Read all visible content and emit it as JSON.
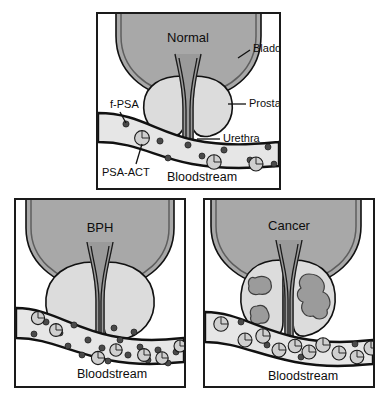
{
  "figure": {
    "background_color": "#ffffff",
    "border_color": "#1a1a1a"
  },
  "colors": {
    "bladder_fill": "#a8a8a8",
    "bladder_wall_inner": "#6e6e6e",
    "outline": "#111111",
    "prostate_fill": "#dcdcdc",
    "urethra_fill": "#9a9a9a",
    "vessel_fill": "#e6e6e6",
    "tumor_fill": "#9b9b9b",
    "fpsa_fill": "#4a4a4a",
    "psaact_fill": "#cfcfcf",
    "panel_background": "#ffffff",
    "text": "#0d0d0d"
  },
  "legend": {
    "fpsa_name": "free PSA particle",
    "psaact_name": "PSA-ACT complex particle"
  },
  "panels": [
    {
      "id": "normal",
      "title": "Normal",
      "bloodstream_label": "Bloodstream",
      "callouts": [
        {
          "id": "bladder",
          "label": "Bladder"
        },
        {
          "id": "prostate",
          "label": "Prostate"
        },
        {
          "id": "urethra",
          "label": "Urethra"
        },
        {
          "id": "fpsa",
          "label": "f-PSA"
        },
        {
          "id": "psaact",
          "label": "PSA-ACT"
        }
      ],
      "fpsa_particles": [
        {
          "x": 28,
          "y": 110,
          "r": 3.1
        },
        {
          "x": 62,
          "y": 127,
          "r": 3.1
        },
        {
          "x": 90,
          "y": 131,
          "r": 3.1
        },
        {
          "x": 70,
          "y": 144,
          "r": 3.0
        },
        {
          "x": 104,
          "y": 142,
          "r": 3.0
        },
        {
          "x": 126,
          "y": 136,
          "r": 3.1
        },
        {
          "x": 152,
          "y": 146,
          "r": 3.0
        },
        {
          "x": 170,
          "y": 133,
          "r": 3.0
        },
        {
          "x": 176,
          "y": 150,
          "r": 2.9
        }
      ],
      "psaact_particles": [
        {
          "x": 44,
          "y": 124,
          "r": 7.4
        },
        {
          "x": 116,
          "y": 148,
          "r": 7.2
        },
        {
          "x": 158,
          "y": 150,
          "r": 7.0
        }
      ]
    },
    {
      "id": "bph",
      "title": "BPH",
      "bloodstream_label": "Bloodstream",
      "callouts": [],
      "fpsa_particles": [
        {
          "x": 30,
          "y": 122,
          "r": 3.1
        },
        {
          "x": 18,
          "y": 134,
          "r": 3.0
        },
        {
          "x": 44,
          "y": 133,
          "r": 3.0
        },
        {
          "x": 58,
          "y": 125,
          "r": 3.1
        },
        {
          "x": 52,
          "y": 146,
          "r": 3.0
        },
        {
          "x": 72,
          "y": 140,
          "r": 3.1
        },
        {
          "x": 66,
          "y": 155,
          "r": 3.0
        },
        {
          "x": 86,
          "y": 148,
          "r": 3.1
        },
        {
          "x": 92,
          "y": 161,
          "r": 3.0
        },
        {
          "x": 104,
          "y": 140,
          "r": 3.0
        },
        {
          "x": 112,
          "y": 155,
          "r": 3.1
        },
        {
          "x": 124,
          "y": 147,
          "r": 3.0
        },
        {
          "x": 132,
          "y": 160,
          "r": 3.0
        },
        {
          "x": 142,
          "y": 150,
          "r": 3.1
        },
        {
          "x": 152,
          "y": 163,
          "r": 3.0
        },
        {
          "x": 160,
          "y": 152,
          "r": 3.0
        },
        {
          "x": 98,
          "y": 128,
          "r": 3.0
        },
        {
          "x": 118,
          "y": 132,
          "r": 3.0
        }
      ],
      "psaact_particles": [
        {
          "x": 22,
          "y": 118,
          "r": 6.6
        },
        {
          "x": 40,
          "y": 130,
          "r": 6.4
        },
        {
          "x": 82,
          "y": 158,
          "r": 6.6
        },
        {
          "x": 100,
          "y": 150,
          "r": 6.2
        },
        {
          "x": 128,
          "y": 155,
          "r": 6.4
        },
        {
          "x": 146,
          "y": 158,
          "r": 6.2
        },
        {
          "x": 164,
          "y": 146,
          "r": 6.0
        }
      ]
    },
    {
      "id": "cancer",
      "title": "Cancer",
      "bloodstream_label": "Bloodstream",
      "callouts": [],
      "fpsa_particles": [
        {
          "x": 36,
          "y": 122,
          "r": 3.0
        },
        {
          "x": 62,
          "y": 145,
          "r": 3.0
        },
        {
          "x": 96,
          "y": 157,
          "r": 3.0
        },
        {
          "x": 150,
          "y": 144,
          "r": 3.0
        }
      ],
      "psaact_particles": [
        {
          "x": 16,
          "y": 124,
          "r": 7.2
        },
        {
          "x": 40,
          "y": 140,
          "r": 7.0
        },
        {
          "x": 58,
          "y": 136,
          "r": 7.2
        },
        {
          "x": 74,
          "y": 150,
          "r": 7.0
        },
        {
          "x": 90,
          "y": 146,
          "r": 6.8
        },
        {
          "x": 104,
          "y": 152,
          "r": 7.0
        },
        {
          "x": 118,
          "y": 145,
          "r": 7.2
        },
        {
          "x": 134,
          "y": 153,
          "r": 7.0
        },
        {
          "x": 152,
          "y": 157,
          "r": 6.8
        },
        {
          "x": 166,
          "y": 148,
          "r": 7.0
        }
      ],
      "tumors": [
        {
          "id": "tumor-right-large"
        },
        {
          "id": "tumor-left-upper"
        },
        {
          "id": "tumor-left-lower"
        }
      ]
    }
  ]
}
